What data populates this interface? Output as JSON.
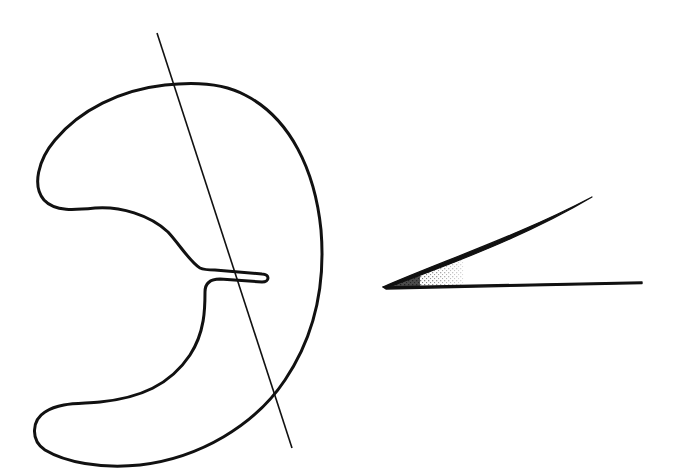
{
  "diagram": {
    "colors": {
      "stroke": "#111111",
      "background": "#ffffff",
      "stipple": "#222222"
    },
    "elements": {
      "stomach_outline": {
        "label": ""
      },
      "cutting_line": {
        "label": "",
        "from": [
          157,
          33
        ],
        "to": [
          292,
          448
        ]
      },
      "angle_wedge": {
        "label": "",
        "vertex": [
          383,
          287
        ],
        "upper_ray_end": [
          592,
          197
        ],
        "lower_ray_end": [
          642,
          282
        ]
      }
    }
  }
}
